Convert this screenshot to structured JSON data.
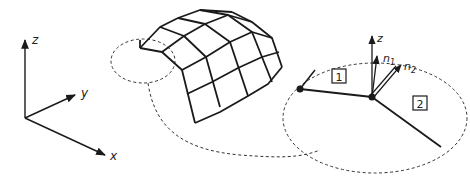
{
  "axes": {
    "x_label": "x",
    "y_label": "y",
    "z_label": "z"
  },
  "detail": {
    "z_label": "z",
    "n1_label": "n",
    "n1_sub": "1",
    "n2_label": "n",
    "n2_sub": "2",
    "region1_label": "1",
    "region2_label": "2"
  },
  "colors": {
    "stroke": "#1a1a1a",
    "background": "#ffffff"
  }
}
